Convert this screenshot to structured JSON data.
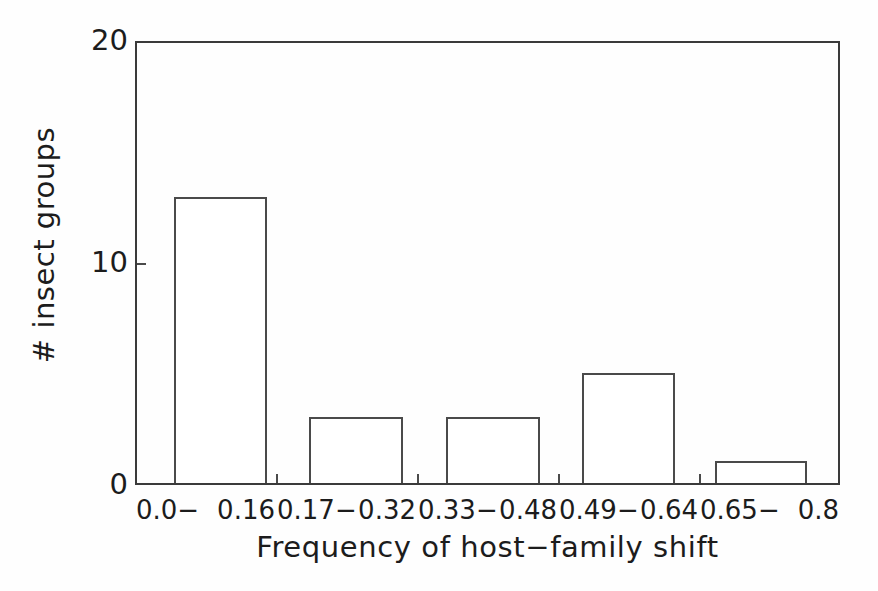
{
  "chart_data": {
    "type": "bar",
    "title": "",
    "subtitle": "",
    "xlabel": "Frequency of host−family shift",
    "ylabel": "# insect groups",
    "categories": [
      "0.0− 0.16",
      "0.17− 0.32",
      "0.33− 0.48",
      "0.49− 0.64",
      "0.65− 0.8"
    ],
    "category_bounds": [
      {
        "low": "0.0−",
        "high": "0.16"
      },
      {
        "low": "0.17−",
        "high": "0.32"
      },
      {
        "low": "0.33−",
        "high": "0.48"
      },
      {
        "low": "0.49−",
        "high": "0.64"
      },
      {
        "low": "0.65−",
        "high": "0.8"
      }
    ],
    "values": [
      13,
      3,
      3,
      5,
      1
    ],
    "ylim": [
      0,
      20
    ],
    "yticks": [
      0,
      10,
      20
    ],
    "ytick_labels": [
      "0",
      "10",
      "20"
    ],
    "grid": false,
    "legend": false,
    "legend_position": "none",
    "bar_fill": "#ffffff",
    "bar_edge_color": "#4a4a4a",
    "axis_color": "#3a3a3a",
    "background": "#fefefe"
  },
  "axes": {
    "y_title": "# insect groups",
    "x_title": "Frequency of host−family shift"
  }
}
